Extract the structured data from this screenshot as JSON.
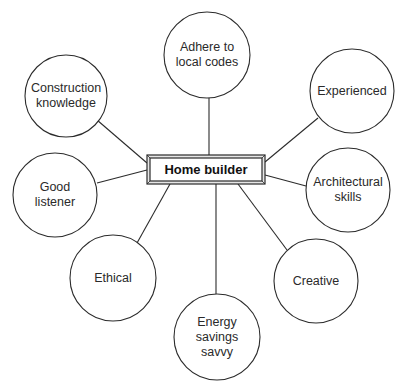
{
  "center": {
    "label": "Home builder",
    "box": {
      "x": 147,
      "y": 155,
      "w": 118,
      "h": 29
    }
  },
  "nodes": [
    {
      "id": "adhere",
      "label": "Adhere to\nlocal codes",
      "cx": 207,
      "cy": 55,
      "r": 43,
      "line": [
        209,
        98,
        209,
        155
      ]
    },
    {
      "id": "experienced",
      "label": "Experienced",
      "cx": 352,
      "cy": 91,
      "r": 42,
      "line": [
        318,
        118,
        265,
        162
      ]
    },
    {
      "id": "architectural",
      "label": "Architectural\nskills",
      "cx": 348,
      "cy": 190,
      "r": 42,
      "line": [
        306,
        186,
        265,
        175
      ]
    },
    {
      "id": "creative",
      "label": "Creative",
      "cx": 316,
      "cy": 281,
      "r": 42,
      "line": [
        287,
        250,
        238,
        184
      ]
    },
    {
      "id": "energy",
      "label": "Energy\nsavings\nsavvy",
      "cx": 217,
      "cy": 337,
      "r": 43,
      "line": [
        216,
        294,
        216,
        184
      ]
    },
    {
      "id": "ethical",
      "label": "Ethical",
      "cx": 113,
      "cy": 278,
      "r": 43,
      "line": [
        137,
        243,
        170,
        184
      ]
    },
    {
      "id": "listener",
      "label": "Good\nlistener",
      "cx": 55,
      "cy": 195,
      "r": 42,
      "line": [
        97,
        183,
        147,
        170
      ]
    },
    {
      "id": "construction",
      "label": "Construction\nknowledge",
      "cx": 66,
      "cy": 96,
      "r": 41,
      "line": [
        97,
        120,
        147,
        163
      ]
    }
  ],
  "colors": {
    "stroke": "#2b2b2b",
    "box_fill": "#ffffff",
    "frame_fill": "#e6e6e6"
  }
}
